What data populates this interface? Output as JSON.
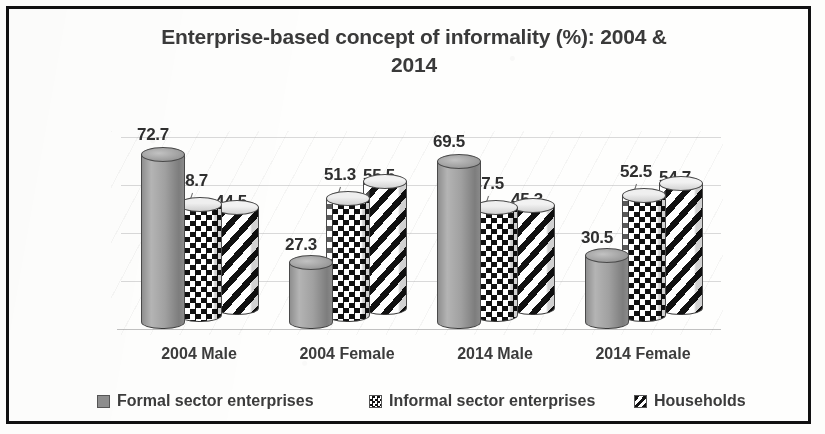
{
  "chart_data": {
    "type": "bar",
    "title": "Enterprise-based concept of informality (%): 2004 & 2014",
    "title_line1": "Enterprise-based concept of informality (%): 2004 &",
    "title_line2": "2014",
    "xlabel": "",
    "ylabel": "",
    "ylim": [
      0,
      80
    ],
    "grid": true,
    "legend_position": "bottom",
    "ticks": [
      "0.0",
      "20.0",
      "40.0",
      "60.0",
      "80.0"
    ],
    "tick_values": [
      0,
      20,
      40,
      60,
      80
    ],
    "categories": [
      "2004 Male",
      "2004 Female",
      "2014 Male",
      "2014 Female"
    ],
    "series": [
      {
        "name": "Formal sector enterprises",
        "key": "solid-grey",
        "values": [
          72.7,
          27.3,
          69.5,
          30.5
        ],
        "labels": [
          "72.7",
          "27.3",
          "69.5",
          "30.5"
        ]
      },
      {
        "name": "Informal sector enterprises",
        "key": "checkerboard",
        "values": [
          48.7,
          51.3,
          47.5,
          52.5
        ],
        "labels": [
          "48.7",
          "51.3",
          "47.5",
          "52.5"
        ]
      },
      {
        "name": "Households",
        "key": "diagonal-stripes",
        "values": [
          44.5,
          55.5,
          45.3,
          54.7
        ],
        "labels": [
          "44.5",
          "55.5",
          "45.3",
          "54.7"
        ]
      }
    ],
    "colors": {
      "series1": "#8e8e8e",
      "series2": "#111111",
      "series3": "#111111",
      "text": "#3c3c3c",
      "border": "#111111",
      "background": "#fefefd"
    }
  }
}
